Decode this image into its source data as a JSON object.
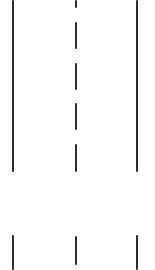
{
  "map": {
    "type": "road-lane-markings",
    "line_color": "#2b2b2b",
    "background": "#ffffff",
    "left_edge": {
      "x": 12,
      "segments": [
        {
          "y": 0,
          "h": 172
        },
        {
          "y": 235,
          "h": 35
        }
      ]
    },
    "center_line": {
      "x": 75,
      "segments": [
        {
          "y": 0,
          "h": 8
        },
        {
          "y": 22,
          "h": 27
        },
        {
          "y": 63,
          "h": 27
        },
        {
          "y": 103,
          "h": 27
        },
        {
          "y": 144,
          "h": 28
        },
        {
          "y": 236,
          "h": 29
        }
      ]
    },
    "right_edge": {
      "x": 136,
      "segments": [
        {
          "y": 0,
          "h": 172
        },
        {
          "y": 235,
          "h": 35
        }
      ]
    }
  }
}
